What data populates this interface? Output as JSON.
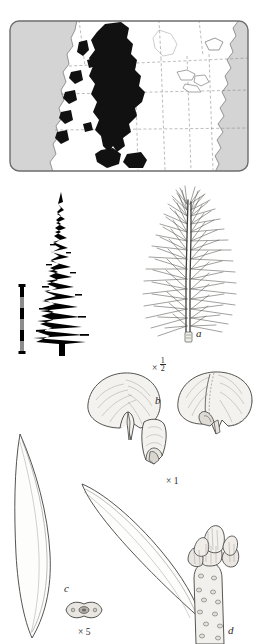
{
  "plate": {
    "title": "Conifer species plate",
    "panels": [
      {
        "id": "distribution-map",
        "kind": "map",
        "region": "western North America",
        "ocean_color": "#d4d4d4",
        "land_color": "#ffffff",
        "range_color": "#111111",
        "border_color": "#6d6d6d",
        "boundary_style": "dashed"
      },
      {
        "id": "tree-silhouette",
        "kind": "habit-silhouette",
        "color": "#000000"
      },
      {
        "id": "scale-bar",
        "kind": "scale-bar",
        "segments": 6,
        "dark_color": "#000000",
        "light_color": "#8c8c8c"
      }
    ]
  },
  "figures": {
    "a": {
      "label": "a",
      "scale_prefix": "×",
      "scale_value": "1/2",
      "scale_numerator": "1",
      "scale_denominator": "2",
      "subject": "leafy branchlet"
    },
    "b": {
      "label": "b",
      "scale_prefix": "×",
      "scale_value": "1",
      "subject": "cone scales and bract"
    },
    "c": {
      "label": "c",
      "scale_prefix": "×",
      "scale_value": "5",
      "subject": "needle and needle cross-section"
    },
    "d": {
      "label": "d",
      "scale_value": "",
      "subject": "shoot tip with terminal bud"
    }
  },
  "colors": {
    "ink": "#1f1f1f",
    "line": "#3a3a3a",
    "fill_light": "#f4f2ee",
    "ocean": "#d4d4d4",
    "range": "#111111"
  }
}
